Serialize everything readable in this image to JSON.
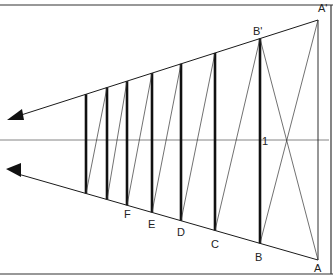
{
  "colors": {
    "line": "#1a1a1a",
    "horizon": "#555555",
    "frame": "#333333",
    "background": "#ffffff"
  },
  "labels": {
    "a_top": "A'",
    "b_top": "B'",
    "a_bottom": "A",
    "b_bottom": "B",
    "c_bottom": "C",
    "d_bottom": "D",
    "e_bottom": "E",
    "f_bottom": "F",
    "horizon_point": "1"
  },
  "posts": [
    {
      "id": "post-7",
      "label": ""
    },
    {
      "id": "post-6",
      "label": ""
    },
    {
      "id": "post-f",
      "label": "F"
    },
    {
      "id": "post-e",
      "label": "E"
    },
    {
      "id": "post-d",
      "label": "D"
    },
    {
      "id": "post-c",
      "label": "C"
    },
    {
      "id": "post-b",
      "label": "B"
    },
    {
      "id": "post-a",
      "label": "A"
    }
  ]
}
